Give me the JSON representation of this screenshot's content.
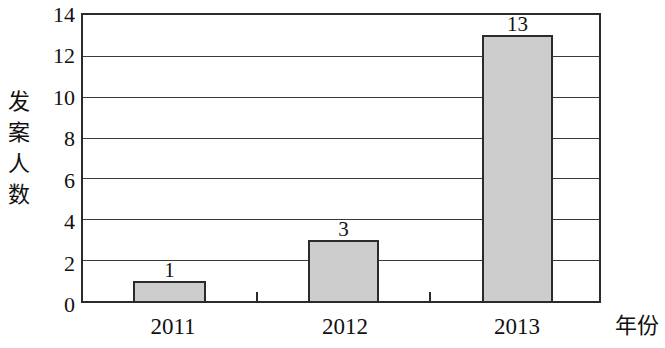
{
  "chart_data": {
    "type": "bar",
    "title": "",
    "subtitle": "",
    "categories": [
      "2011",
      "2012",
      "2013"
    ],
    "values": [
      1,
      3,
      13
    ],
    "data_labels": [
      "1",
      "3",
      "13"
    ],
    "xlabel": "年份",
    "ylabel": "发案人数",
    "ylabel_chars": [
      "发",
      "案",
      "人",
      "数"
    ],
    "ylim": [
      0,
      14
    ],
    "yticks": [
      14,
      12,
      10,
      8,
      6,
      4,
      2,
      0
    ],
    "ytick_labels": [
      "14",
      "12",
      "10",
      "8",
      "6",
      "4",
      "2",
      "0"
    ],
    "grid": true,
    "grid_axis": "y",
    "legend": false,
    "series": [
      {
        "name": "发案人数",
        "values": [
          1,
          3,
          13
        ]
      }
    ],
    "colors": {
      "bar_fill": "#cdcdcd",
      "bar_border": "#2b2b2b",
      "axis": "#2b2b2b",
      "gridline": "#3a3a3a",
      "text": "#111111",
      "background": "#ffffff"
    }
  }
}
